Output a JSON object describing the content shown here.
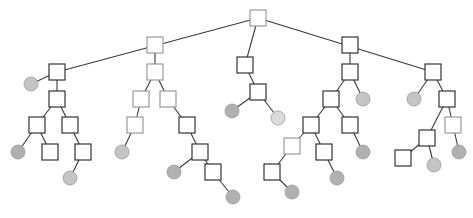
{
  "diagram": {
    "type": "tree",
    "width": 473,
    "height": 218,
    "colors": {
      "edge": "#3a3a3a",
      "square_fill": "#ffffff",
      "square_stroke_dark": "#333333",
      "square_stroke_light": "#9a9a9a",
      "circle_fill": "#c4c4c4",
      "circle_fill_dark": "#b0b0b0",
      "circle_fill_light": "#dadada"
    },
    "nodes": [
      {
        "id": "n0",
        "shape": "square",
        "x": 258,
        "y": 18,
        "tone": "light"
      },
      {
        "id": "a1",
        "shape": "square",
        "x": 57,
        "y": 72,
        "tone": "dark"
      },
      {
        "id": "a2",
        "shape": "circle",
        "x": 31,
        "y": 84,
        "tone": "mid"
      },
      {
        "id": "a3",
        "shape": "square",
        "x": 57,
        "y": 99,
        "tone": "dark"
      },
      {
        "id": "a4",
        "shape": "square",
        "x": 37,
        "y": 125,
        "tone": "dark"
      },
      {
        "id": "a5",
        "shape": "square",
        "x": 70,
        "y": 125,
        "tone": "dark"
      },
      {
        "id": "a6",
        "shape": "circle",
        "x": 18,
        "y": 152,
        "tone": "dark"
      },
      {
        "id": "a7",
        "shape": "square",
        "x": 50,
        "y": 152,
        "tone": "dark"
      },
      {
        "id": "a8",
        "shape": "square",
        "x": 83,
        "y": 152,
        "tone": "dark"
      },
      {
        "id": "a9",
        "shape": "circle",
        "x": 70,
        "y": 178,
        "tone": "mid"
      },
      {
        "id": "b1",
        "shape": "square",
        "x": 155,
        "y": 45,
        "tone": "light"
      },
      {
        "id": "b2",
        "shape": "square",
        "x": 155,
        "y": 72,
        "tone": "light"
      },
      {
        "id": "b3",
        "shape": "square",
        "x": 141,
        "y": 99,
        "tone": "light"
      },
      {
        "id": "b4",
        "shape": "square",
        "x": 168,
        "y": 99,
        "tone": "light"
      },
      {
        "id": "b5",
        "shape": "square",
        "x": 135,
        "y": 125,
        "tone": "light"
      },
      {
        "id": "b6",
        "shape": "circle",
        "x": 122,
        "y": 152,
        "tone": "mid"
      },
      {
        "id": "b7",
        "shape": "square",
        "x": 187,
        "y": 125,
        "tone": "dark"
      },
      {
        "id": "b8",
        "shape": "square",
        "x": 200,
        "y": 152,
        "tone": "dark"
      },
      {
        "id": "b9",
        "shape": "circle",
        "x": 174,
        "y": 172,
        "tone": "dark"
      },
      {
        "id": "b10",
        "shape": "square",
        "x": 213,
        "y": 172,
        "tone": "dark"
      },
      {
        "id": "b11",
        "shape": "circle",
        "x": 233,
        "y": 197,
        "tone": "dark"
      },
      {
        "id": "c1",
        "shape": "square",
        "x": 245,
        "y": 65,
        "tone": "dark"
      },
      {
        "id": "c2",
        "shape": "square",
        "x": 258,
        "y": 92,
        "tone": "dark"
      },
      {
        "id": "c3",
        "shape": "circle",
        "x": 232,
        "y": 111,
        "tone": "dark"
      },
      {
        "id": "c4",
        "shape": "circle",
        "x": 278,
        "y": 118,
        "tone": "light"
      },
      {
        "id": "d1",
        "shape": "square",
        "x": 350,
        "y": 45,
        "tone": "dark"
      },
      {
        "id": "d2",
        "shape": "square",
        "x": 350,
        "y": 72,
        "tone": "dark"
      },
      {
        "id": "d3",
        "shape": "square",
        "x": 331,
        "y": 99,
        "tone": "dark"
      },
      {
        "id": "d4",
        "shape": "circle",
        "x": 363,
        "y": 99,
        "tone": "mid"
      },
      {
        "id": "d5",
        "shape": "square",
        "x": 311,
        "y": 125,
        "tone": "dark"
      },
      {
        "id": "d6",
        "shape": "square",
        "x": 350,
        "y": 125,
        "tone": "dark"
      },
      {
        "id": "d7",
        "shape": "square",
        "x": 292,
        "y": 146,
        "tone": "light"
      },
      {
        "id": "d8",
        "shape": "square",
        "x": 324,
        "y": 152,
        "tone": "dark"
      },
      {
        "id": "d9",
        "shape": "circle",
        "x": 363,
        "y": 152,
        "tone": "dark"
      },
      {
        "id": "d10",
        "shape": "square",
        "x": 272,
        "y": 172,
        "tone": "dark"
      },
      {
        "id": "d11",
        "shape": "circle",
        "x": 337,
        "y": 178,
        "tone": "dark"
      },
      {
        "id": "d12",
        "shape": "circle",
        "x": 292,
        "y": 192,
        "tone": "dark"
      },
      {
        "id": "e1",
        "shape": "square",
        "x": 433,
        "y": 72,
        "tone": "dark"
      },
      {
        "id": "e2",
        "shape": "circle",
        "x": 414,
        "y": 99,
        "tone": "mid"
      },
      {
        "id": "e3",
        "shape": "square",
        "x": 447,
        "y": 99,
        "tone": "dark"
      },
      {
        "id": "e4",
        "shape": "square",
        "x": 427,
        "y": 138,
        "tone": "dark"
      },
      {
        "id": "e5",
        "shape": "square",
        "x": 453,
        "y": 125,
        "tone": "light"
      },
      {
        "id": "e6",
        "shape": "square",
        "x": 403,
        "y": 158,
        "tone": "dark"
      },
      {
        "id": "e7",
        "shape": "circle",
        "x": 434,
        "y": 165,
        "tone": "mid"
      },
      {
        "id": "e8",
        "shape": "circle",
        "x": 459,
        "y": 152,
        "tone": "dark"
      }
    ],
    "edges": [
      [
        "n0",
        "a1"
      ],
      [
        "n0",
        "c1"
      ],
      [
        "n0",
        "e1"
      ],
      [
        "a1",
        "a2"
      ],
      [
        "a1",
        "a3"
      ],
      [
        "a3",
        "a4"
      ],
      [
        "a3",
        "a5"
      ],
      [
        "a4",
        "a6"
      ],
      [
        "a4",
        "a7"
      ],
      [
        "a5",
        "a8"
      ],
      [
        "a8",
        "a9"
      ],
      [
        "b1",
        "b2"
      ],
      [
        "b2",
        "b3"
      ],
      [
        "b2",
        "b4"
      ],
      [
        "b3",
        "b5"
      ],
      [
        "b5",
        "b6"
      ],
      [
        "b4",
        "b7"
      ],
      [
        "b7",
        "b8"
      ],
      [
        "b8",
        "b9"
      ],
      [
        "b8",
        "b10"
      ],
      [
        "b10",
        "b11"
      ],
      [
        "c1",
        "c2"
      ],
      [
        "c2",
        "c3"
      ],
      [
        "c2",
        "c4"
      ],
      [
        "d1",
        "d2"
      ],
      [
        "d2",
        "d3"
      ],
      [
        "d2",
        "d4"
      ],
      [
        "d3",
        "d5"
      ],
      [
        "d3",
        "d6"
      ],
      [
        "d5",
        "d7"
      ],
      [
        "d7",
        "d10"
      ],
      [
        "d10",
        "d12"
      ],
      [
        "d5",
        "d8"
      ],
      [
        "d8",
        "d11"
      ],
      [
        "d6",
        "d9"
      ],
      [
        "e1",
        "e2"
      ],
      [
        "e1",
        "e3"
      ],
      [
        "e3",
        "e4"
      ],
      [
        "e3",
        "e5"
      ],
      [
        "e4",
        "e6"
      ],
      [
        "e4",
        "e7"
      ],
      [
        "e5",
        "e8"
      ]
    ],
    "node_size": 16,
    "circle_radius": 7
  }
}
